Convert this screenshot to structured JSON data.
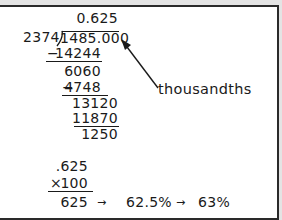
{
  "long_division": {
    "quotient": "0.625",
    "divisor": "2374",
    "dividend": "1485.000",
    "steps": [
      {
        "subtract": "14244",
        "sign": "−"
      },
      {
        "remainder": "6060"
      },
      {
        "subtract": "4748",
        "sign": "−"
      },
      {
        "remainder": "13120"
      },
      {
        "subtract": "11870"
      },
      {
        "remainder": "1250"
      }
    ]
  },
  "annotation": {
    "label": "thousandths",
    "arrow": "arrow-pointing-to-thousandths-place"
  },
  "multiplication": {
    "multiplicand": ".625",
    "operator": "×",
    "multiplier": "100",
    "product": "625"
  },
  "conversion": {
    "arrow1": "→",
    "percent": "62.5%",
    "arrow2": "→",
    "rounded": "63%"
  }
}
